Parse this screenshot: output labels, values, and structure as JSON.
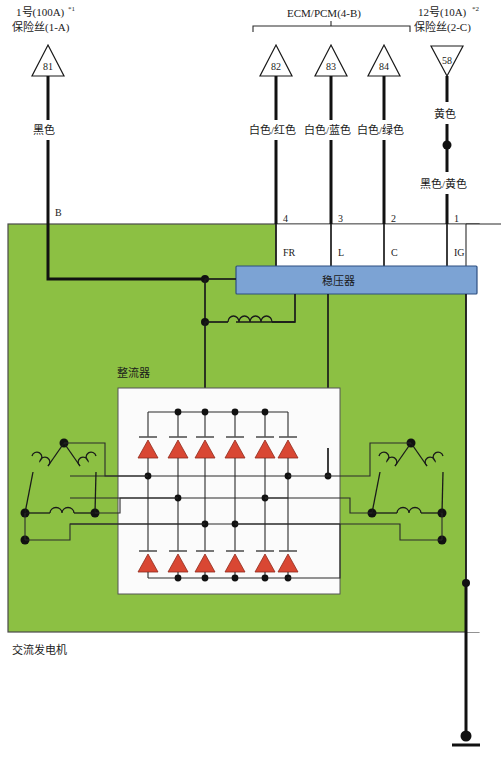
{
  "diagram": {
    "title_bottom": "交流发电机",
    "rectifier_label": "整流器",
    "regulator_label": "稳压器",
    "ecm_label": "ECM/PCM(4-B)",
    "colors": {
      "alternator_body": "#8cc043",
      "regulator": "#7ca3d4",
      "diode": "#d94733",
      "wire": "#1a1a1a"
    }
  },
  "fuses": {
    "left": {
      "line1": "1号(100A)",
      "sup1": "*1",
      "line2": "保险丝(1-A)",
      "node_number": "81",
      "wire_color": "黑色",
      "terminal": "B"
    },
    "right": {
      "line1": "12号(10A)",
      "sup1": "*2",
      "line2": "保险丝(2-C)",
      "node_number": "58",
      "wire_color": "黄色",
      "wire_color2": "黑色/黄色"
    }
  },
  "ecm": {
    "label": "ECM/PCM(4-B)",
    "nodes": [
      {
        "number": "82",
        "wire_color": "白色/红色",
        "pin": "4",
        "terminal": "FR"
      },
      {
        "number": "83",
        "wire_color": "白色/蓝色",
        "pin": "3",
        "terminal": "L"
      },
      {
        "number": "84",
        "wire_color": "白色/绿色",
        "pin": "2",
        "terminal": "C"
      }
    ]
  },
  "ig": {
    "pin": "1",
    "terminal": "IG"
  },
  "components": {
    "regulator": "稳压器",
    "rectifier": "整流器",
    "alternator": "交流发电机",
    "diode_count_top": 6,
    "diode_count_bottom": 6,
    "stator_windings": 2,
    "winding_type": "delta"
  }
}
